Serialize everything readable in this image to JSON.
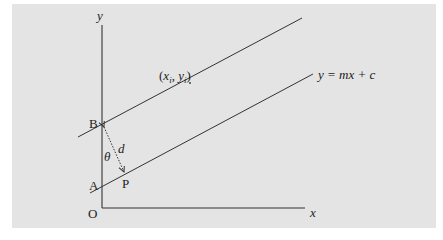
{
  "figure": {
    "background": "#e4e4e4",
    "line_color": "#333333",
    "axes": {
      "y_label": "y",
      "x_label": "x",
      "origin_label": "O"
    },
    "points": {
      "B": "B",
      "A": "A",
      "P": "P"
    },
    "annotations": {
      "distance": "d",
      "angle": "θ",
      "point_open": "(",
      "point_x": "x",
      "point_x_sub": "i",
      "point_sep": ", ",
      "point_y": "y",
      "point_y_sub": "i",
      "point_close": ")",
      "line_equation": "y = mx + c"
    },
    "lines": [
      {
        "name": "upper-parallel-line",
        "from": [
          78,
          137
        ],
        "to": [
          302,
          18
        ]
      },
      {
        "name": "regression-line",
        "from": [
          90,
          193
        ],
        "to": [
          313,
          74
        ]
      }
    ],
    "perpendicular": {
      "from": [
        104,
        127
      ],
      "to": [
        124,
        172
      ],
      "style": "dotted",
      "arrows": "both"
    }
  }
}
